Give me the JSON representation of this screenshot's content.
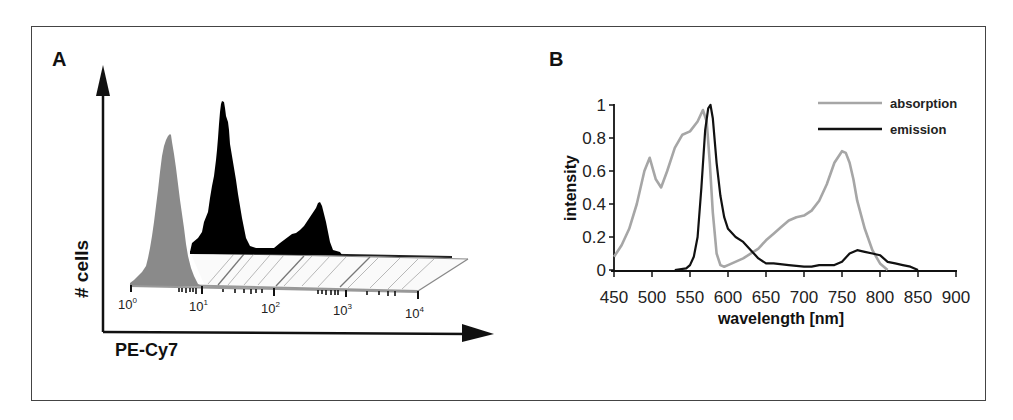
{
  "panels": {
    "a": {
      "label": "A",
      "y_axis_title": "# cells",
      "x_axis_title": "PE-Cy7",
      "log_ticks": [
        {
          "base": "10",
          "exp": "0"
        },
        {
          "base": "10",
          "exp": "1"
        },
        {
          "base": "10",
          "exp": "2"
        },
        {
          "base": "10",
          "exp": "3"
        },
        {
          "base": "10",
          "exp": "4"
        }
      ]
    },
    "b": {
      "label": "B",
      "y_axis_title": "intensity",
      "x_axis_title": "wavelength [nm]",
      "y_ticks": [
        "0",
        "0.2",
        "0.4",
        "0.6",
        "0.8",
        "1"
      ],
      "x_ticks": [
        "450",
        "500",
        "550",
        "600",
        "650",
        "700",
        "750",
        "800",
        "850",
        "900"
      ],
      "legend": [
        {
          "name": "absorption",
          "color": "#a6a6a6"
        },
        {
          "name": "emission",
          "color": "#111111"
        }
      ]
    }
  },
  "chart_data": [
    {
      "type": "area",
      "title": "A",
      "xlabel": "PE-Cy7",
      "ylabel": "# cells",
      "x_scale": "log",
      "xlim": [
        1,
        10000
      ],
      "tick_labels": [
        "10^0",
        "10^1",
        "10^2",
        "10^3",
        "10^4"
      ],
      "series": [
        {
          "name": "control (gray, front)",
          "color": "#8c8c8c",
          "description": "single peak",
          "x": [
            1.0,
            2.0,
            3.0,
            4.0,
            5.0,
            6.0,
            8.0
          ],
          "y": [
            0.0,
            0.15,
            0.55,
            1.0,
            0.6,
            0.25,
            0.0
          ]
        },
        {
          "name": "stained (black, back)",
          "color": "#000000",
          "description": "bimodal: major peak ~20, minor peak ~400",
          "x": [
            6,
            10,
            15,
            20,
            30,
            50,
            60,
            100,
            150,
            250,
            400,
            600,
            800
          ],
          "y": [
            0.0,
            0.2,
            0.6,
            1.0,
            0.7,
            0.15,
            0.02,
            0.02,
            0.08,
            0.2,
            0.4,
            0.15,
            0.0
          ]
        }
      ],
      "grid": false,
      "legend": null
    },
    {
      "type": "line",
      "title": "B",
      "xlabel": "wavelength [nm]",
      "ylabel": "intensity",
      "xlim": [
        450,
        900
      ],
      "ylim": [
        0,
        1
      ],
      "xticks": [
        450,
        500,
        550,
        600,
        650,
        700,
        750,
        800,
        850,
        900
      ],
      "yticks": [
        0,
        0.2,
        0.4,
        0.6,
        0.8,
        1
      ],
      "grid": false,
      "legend_position": "upper right",
      "series": [
        {
          "name": "absorption",
          "color": "#a6a6a6",
          "x": [
            450,
            460,
            470,
            480,
            490,
            497,
            505,
            512,
            520,
            530,
            540,
            550,
            560,
            567,
            572,
            576,
            580,
            585,
            590,
            595,
            600,
            620,
            640,
            650,
            660,
            670,
            680,
            690,
            700,
            710,
            720,
            730,
            740,
            750,
            755,
            760,
            765,
            770,
            780,
            790,
            800,
            810
          ],
          "y": [
            0.08,
            0.15,
            0.25,
            0.4,
            0.6,
            0.68,
            0.55,
            0.5,
            0.6,
            0.74,
            0.82,
            0.84,
            0.9,
            0.97,
            0.9,
            0.65,
            0.35,
            0.1,
            0.03,
            0.02,
            0.03,
            0.07,
            0.13,
            0.18,
            0.22,
            0.26,
            0.3,
            0.32,
            0.33,
            0.36,
            0.42,
            0.52,
            0.65,
            0.72,
            0.71,
            0.65,
            0.55,
            0.42,
            0.25,
            0.12,
            0.04,
            0.0
          ]
        },
        {
          "name": "emission",
          "color": "#111111",
          "x": [
            530,
            545,
            550,
            555,
            560,
            565,
            570,
            574,
            577,
            580,
            585,
            590,
            595,
            600,
            610,
            620,
            630,
            640,
            650,
            660,
            680,
            700,
            710,
            720,
            740,
            750,
            760,
            770,
            780,
            790,
            800,
            810,
            820,
            830,
            840,
            850
          ],
          "y": [
            0.0,
            0.01,
            0.03,
            0.08,
            0.2,
            0.5,
            0.85,
            0.98,
            1.0,
            0.92,
            0.65,
            0.45,
            0.32,
            0.25,
            0.2,
            0.17,
            0.12,
            0.07,
            0.04,
            0.04,
            0.03,
            0.02,
            0.02,
            0.03,
            0.03,
            0.05,
            0.1,
            0.12,
            0.11,
            0.1,
            0.09,
            0.05,
            0.04,
            0.03,
            0.02,
            0.0
          ]
        }
      ]
    }
  ]
}
